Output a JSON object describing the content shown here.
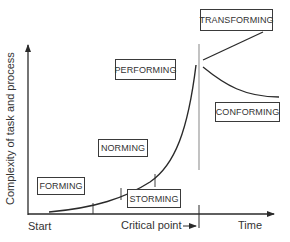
{
  "diagram": {
    "y_axis_label": "Complexity of task and process",
    "x_axis_labels": {
      "start": "Start",
      "critical_point": "Critical point",
      "critical_arrow": "→",
      "time": "Time"
    },
    "stages": [
      {
        "id": "forming",
        "label": "FORMING"
      },
      {
        "id": "storming",
        "label": "STORMING"
      },
      {
        "id": "norming",
        "label": "NORMING"
      },
      {
        "id": "performing",
        "label": "PERFORMING"
      },
      {
        "id": "transforming",
        "label": "TRANSFORMING"
      },
      {
        "id": "conforming",
        "label": "CONFORMING"
      }
    ],
    "colors": {
      "line": "#2a2a2a",
      "divider": "#9a9a9a",
      "background": "#ffffff"
    }
  }
}
